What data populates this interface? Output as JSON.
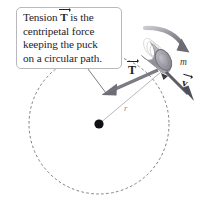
{
  "figure": {
    "width": 202,
    "height": 215,
    "background_color": "#ffffff"
  },
  "callout": {
    "name": "tension-explanation-callout",
    "border_color": "#b9b9bd",
    "background_color": "#ffffff",
    "text_color": "#262329",
    "lines": [
      {
        "before": "Tension ",
        "symbol": "T",
        "after": " is the"
      },
      {
        "before": "centripetal force",
        "symbol": "",
        "after": ""
      },
      {
        "before": "keeping the puck",
        "symbol": "",
        "after": ""
      },
      {
        "before": "on a circular path.",
        "symbol": "",
        "after": ""
      }
    ],
    "full_text": "Tension T is the centripetal force keeping the puck on a circular path."
  },
  "labels": {
    "tension_vector": "T",
    "mass": "m",
    "radius": "r",
    "velocity_vector": "v"
  },
  "colors": {
    "text": "#262329",
    "dashed_path": "#6f6d74",
    "tension_arrow": "#7a7880",
    "velocity_arrow": "#5e5c64",
    "rotation_arrow": "#8a8890",
    "radius_line": "#a7a5ab",
    "center_dot": "#111014",
    "puck_body": "#a9a7ae",
    "puck_face": "#9a98a0",
    "leader_line": "#6f6d74"
  },
  "geometry": {
    "circle_center": {
      "x": 99,
      "y": 124
    },
    "circle_radius": 70,
    "puck_position": {
      "x": 163,
      "y": 58
    },
    "dash_pattern": "2.6 2.4"
  },
  "elements": {
    "center_dot_name": "circle-center-dot",
    "dashed_circle_name": "circular-path-dashed",
    "tension_arrow_name": "tension-force-arrow",
    "velocity_arrow_name": "velocity-vector-arrow",
    "rotation_arrow_name": "rotation-direction-arrow",
    "radius_line_name": "radius-line",
    "puck_name": "puck-cylinder",
    "leader_name": "callout-leader-line"
  }
}
